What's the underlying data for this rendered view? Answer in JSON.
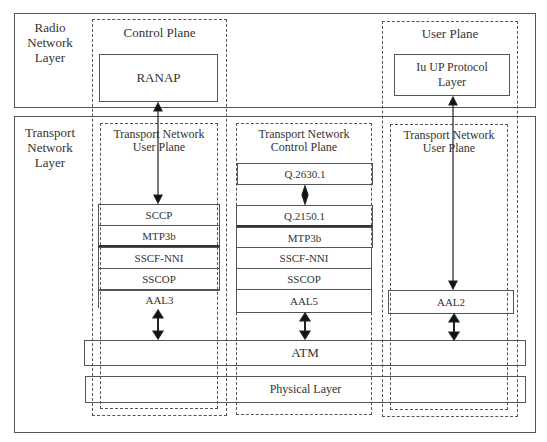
{
  "layers": {
    "radio": "Radio Network Layer",
    "radio_lines": [
      "Radio",
      "Network",
      "Layer"
    ],
    "transport_lines": [
      "Transport",
      "Network",
      "Layer"
    ]
  },
  "planes": {
    "control": "Control Plane",
    "user": "User Plane"
  },
  "sub_planes": {
    "tn_user_left": [
      "Transport  Network",
      "User  Plane"
    ],
    "tn_control": [
      "Transport Network",
      "Control Plane"
    ],
    "tn_user_right": [
      "Transport  Network",
      "User  Plane"
    ]
  },
  "boxes": {
    "ranap": "RANAP",
    "iu_up": [
      "Iu UP Protocol",
      "Layer"
    ]
  },
  "stacks": {
    "left": [
      "SCCP",
      "MTP3b",
      "SSCF-NNI",
      "SSCOP",
      "AAL3"
    ],
    "middle": [
      "Q.2630.1",
      "Q.2150.1",
      "MTP3b",
      "SSCF-NNI",
      "SSCOP",
      "AAL5"
    ],
    "right": [
      "AAL2"
    ]
  },
  "shared": {
    "atm": "ATM",
    "physical": "Physical Layer"
  }
}
